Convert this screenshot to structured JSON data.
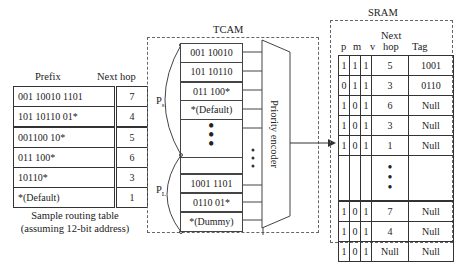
{
  "routing_table": {
    "header_prefix": "Prefix",
    "header_nexthop": "Next hop",
    "rows": [
      {
        "prefix": "001 10010 1101",
        "hop": "7"
      },
      {
        "prefix": "101 10110 01*",
        "hop": "4"
      },
      {
        "prefix": "001100 10*",
        "hop": "5"
      },
      {
        "prefix": "011 100*",
        "hop": "6"
      },
      {
        "prefix": "10110*",
        "hop": "3"
      },
      {
        "prefix": "*(Default)",
        "hop": "1"
      }
    ],
    "caption_line1": "Sample routing table",
    "caption_line2": "(assuming 12-bit  address)"
  },
  "tcam": {
    "title": "TCAM",
    "ps_label": "P",
    "ps_sub": "s",
    "pl_label": "P",
    "pl_sub": "L",
    "entries_top": [
      "001 10010",
      "101 10110",
      "011 100*",
      "*(Default)"
    ],
    "entries_bottom": [
      "1001 1101",
      "0110 01*",
      "*(Dummy)"
    ],
    "ellipsis": "⋮",
    "encoder_label": "Priority encoder"
  },
  "sram": {
    "title": "SRAM",
    "headers": {
      "p": "p",
      "m": "m",
      "v": "v",
      "nexthop_1": "Next",
      "nexthop_2": "hop",
      "tag": "Tag"
    },
    "rows_top": [
      {
        "p": "1",
        "m": "1",
        "v": "1",
        "hop": "5",
        "tag": "1001"
      },
      {
        "p": "0",
        "m": "1",
        "v": "1",
        "hop": "3",
        "tag": "0110"
      },
      {
        "p": "1",
        "m": "0",
        "v": "1",
        "hop": "6",
        "tag": "Null"
      },
      {
        "p": "1",
        "m": "0",
        "v": "1",
        "hop": "3",
        "tag": "Null"
      },
      {
        "p": "1",
        "m": "0",
        "v": "1",
        "hop": "1",
        "tag": "Null"
      }
    ],
    "rows_bottom": [
      {
        "p": "1",
        "m": "0",
        "v": "1",
        "hop": "7",
        "tag": "Null"
      },
      {
        "p": "1",
        "m": "0",
        "v": "1",
        "hop": "4",
        "tag": "Null"
      },
      {
        "p": "1",
        "m": "0",
        "v": "1",
        "hop": "Null",
        "tag": "Null"
      }
    ]
  }
}
